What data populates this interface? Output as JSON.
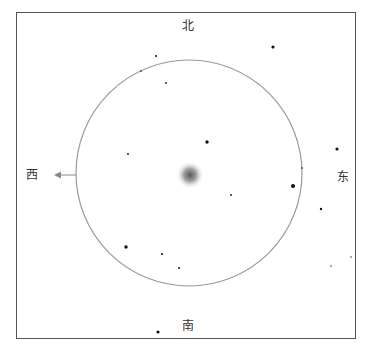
{
  "caption": "· · · · · · · · · · · · ·",
  "compass": {
    "north": "北",
    "south": "南",
    "east": "东",
    "west": "西"
  },
  "view": {
    "circle_center": [
      189,
      173
    ],
    "circle_radius": 113,
    "circle_color": "#9a9a9a",
    "target_center": [
      190,
      175
    ],
    "arrow_direction": "west"
  },
  "stars": [
    {
      "x": 156,
      "y": 56,
      "r": 1.0
    },
    {
      "x": 141,
      "y": 71,
      "r": 0.8
    },
    {
      "x": 166,
      "y": 83,
      "r": 0.9
    },
    {
      "x": 273,
      "y": 47,
      "r": 1.6
    },
    {
      "x": 207,
      "y": 142,
      "r": 1.7
    },
    {
      "x": 128,
      "y": 154,
      "r": 0.9
    },
    {
      "x": 231,
      "y": 195,
      "r": 0.9
    },
    {
      "x": 337,
      "y": 149,
      "r": 1.6
    },
    {
      "x": 302,
      "y": 168,
      "r": 0.8
    },
    {
      "x": 293,
      "y": 186,
      "r": 2.0
    },
    {
      "x": 321,
      "y": 209,
      "r": 1.2
    },
    {
      "x": 126,
      "y": 247,
      "r": 1.7
    },
    {
      "x": 162,
      "y": 254,
      "r": 1.0
    },
    {
      "x": 179,
      "y": 268,
      "r": 1.0
    },
    {
      "x": 331,
      "y": 266,
      "r": 0.7
    },
    {
      "x": 351,
      "y": 257,
      "r": 0.7
    },
    {
      "x": 158,
      "y": 332,
      "r": 1.6
    }
  ]
}
